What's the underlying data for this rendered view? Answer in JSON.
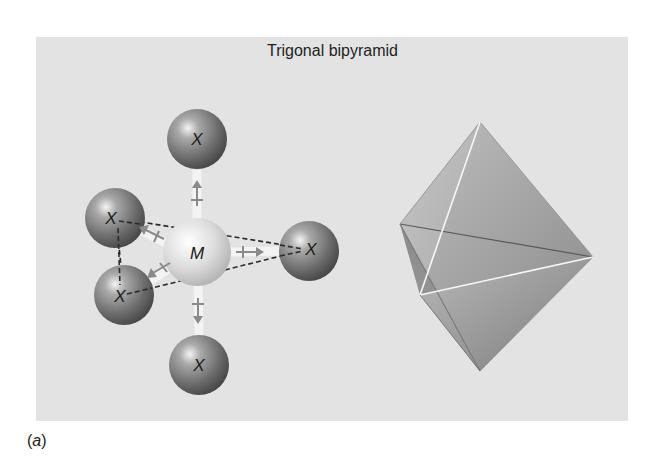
{
  "figure": {
    "title": "Trigonal bipyramid",
    "caption_open": "(",
    "caption_letter": "a",
    "caption_close": ")",
    "background_color": "#e3e3e3"
  },
  "molecule": {
    "central_atom": {
      "label": "M",
      "cx": 197,
      "cy": 252,
      "r": 34
    },
    "ligands": [
      {
        "label": "X",
        "position": "axial-top",
        "cx": 197,
        "cy": 139,
        "r": 30
      },
      {
        "label": "X",
        "position": "axial-bottom",
        "cx": 199,
        "cy": 365,
        "r": 30
      },
      {
        "label": "X",
        "position": "equatorial-upper-left",
        "cx": 115,
        "cy": 218,
        "r": 30
      },
      {
        "label": "X",
        "position": "equatorial-lower-left",
        "cx": 124,
        "cy": 295,
        "r": 30
      },
      {
        "label": "X",
        "position": "equatorial-right",
        "cx": 309,
        "cy": 251,
        "r": 30
      }
    ]
  },
  "polyhedron": {
    "name": "trigonal-bipyramid",
    "vertices": {
      "top": [
        480,
        122
      ],
      "bottom": [
        480,
        371
      ],
      "left": [
        400,
        224
      ],
      "right": [
        593,
        257
      ],
      "front": [
        420,
        295
      ]
    }
  }
}
